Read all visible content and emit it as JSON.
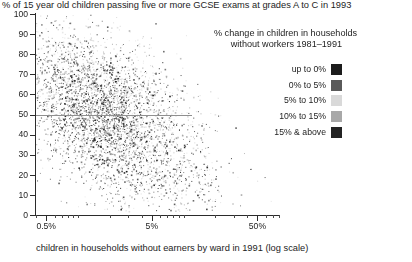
{
  "chart_data": {
    "type": "scatter",
    "title": "% of 15 year old children passing five or more GCSE exams at grades A to C in 1993",
    "xlabel": "children in households without earners by ward in 1991 (log scale)",
    "ylabel": "",
    "xscale": "log",
    "xlim": [
      0.4,
      80
    ],
    "ylim": [
      0,
      100
    ],
    "grid": false,
    "x_tick_labels": [
      "0.5%",
      "5%",
      "50%"
    ],
    "x_tick_values": [
      0.5,
      5,
      50
    ],
    "y_tick_labels": [
      "0",
      "10",
      "20",
      "30",
      "40",
      "50",
      "60",
      "70",
      "80",
      "90",
      "100"
    ],
    "y_tick_values": [
      0,
      10,
      20,
      30,
      40,
      50,
      60,
      70,
      80,
      90,
      100
    ],
    "reference_line": {
      "orientation": "horizontal",
      "y": 50,
      "color": "#8f8f8f",
      "x_extent": [
        0.4,
        12
      ]
    },
    "legend": {
      "position": "top-right",
      "title_line1": "% change in children in households",
      "title_line2": "without workers 1981–1991",
      "entries": [
        {
          "label": "up to 0%",
          "color": "#1c1c1c",
          "bin_min": null,
          "bin_max": 0
        },
        {
          "label": "0% to 5%",
          "color": "#5a5a5a",
          "bin_min": 0,
          "bin_max": 5
        },
        {
          "label": "5% to 10%",
          "color": "#d9d9d9",
          "bin_min": 5,
          "bin_max": 10
        },
        {
          "label": "10% to 15%",
          "color": "#a8a8a8",
          "bin_min": 10,
          "bin_max": 15
        },
        {
          "label": "15% & above",
          "color": "#232323",
          "bin_min": 15,
          "bin_max": null
        }
      ]
    },
    "series": [
      {
        "name": "up to 0%",
        "color": "#1c1c1c",
        "n_points": 640,
        "x_center_log": 0.3,
        "x_spread_log": 0.34,
        "y_center": 47,
        "y_spread": 16,
        "seed": 11
      },
      {
        "name": "0% to 5%",
        "color": "#5a5a5a",
        "n_points": 900,
        "x_center_log": 0.22,
        "x_spread_log": 0.36,
        "y_center": 45,
        "y_spread": 18,
        "seed": 23
      },
      {
        "name": "5% to 10%",
        "color": "#d9d9d9",
        "n_points": 1100,
        "x_center_log": 0.46,
        "x_spread_log": 0.42,
        "y_center": 49,
        "y_spread": 20,
        "seed": 37
      },
      {
        "name": "10% to 15%",
        "color": "#a8a8a8",
        "n_points": 950,
        "x_center_log": 0.52,
        "x_spread_log": 0.42,
        "y_center": 48,
        "y_spread": 20,
        "seed": 53
      },
      {
        "name": "15% & above",
        "color": "#232323",
        "n_points": 700,
        "x_center_log": 0.7,
        "x_spread_log": 0.4,
        "y_center": 44,
        "y_spread": 19,
        "seed": 71
      }
    ]
  }
}
